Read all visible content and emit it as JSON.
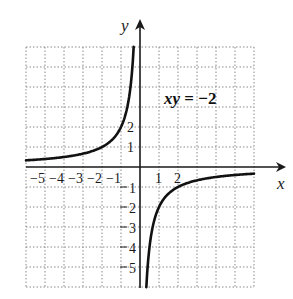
{
  "chart_data": {
    "type": "line",
    "title": "",
    "annotation": "xy = −2",
    "function": "y = -2/x",
    "xlabel": "x",
    "ylabel": "y",
    "xlim": [
      -6,
      6
    ],
    "ylim": [
      -6,
      6
    ],
    "grid": true,
    "grid_style": "dotted",
    "x_tick_labels": [
      "−5",
      "−4",
      "−3",
      "−2",
      "−1",
      "1",
      "2"
    ],
    "x_ticks": [
      -5,
      -4,
      -3,
      -2,
      -1,
      1,
      2
    ],
    "y_tick_labels": [
      "2",
      "1",
      "−1",
      "−2",
      "−3",
      "−4",
      "−5"
    ],
    "y_ticks": [
      2,
      1,
      -1,
      -2,
      -3,
      -4,
      -5
    ],
    "series": [
      {
        "name": "xy = −2 (left branch, x<0)",
        "x": [
          -6,
          -5,
          -4,
          -3,
          -2,
          -1.5,
          -1,
          -0.75,
          -0.5,
          -0.4,
          -0.333
        ],
        "y": [
          0.333,
          0.4,
          0.5,
          0.667,
          1,
          1.333,
          2,
          2.667,
          4,
          5,
          6
        ]
      },
      {
        "name": "xy = −2 (right branch, x>0)",
        "x": [
          0.333,
          0.4,
          0.5,
          0.75,
          1,
          1.5,
          2,
          3,
          4,
          5,
          6
        ],
        "y": [
          -6,
          -5,
          -4,
          -2.667,
          -2,
          -1.333,
          -1,
          -0.667,
          -0.5,
          -0.4,
          -0.333
        ]
      }
    ]
  },
  "labels": {
    "x_axis": "x",
    "y_axis": "y",
    "equation_var": "xy",
    "equation_rest": " = −2",
    "x_ticks": [
      "−5",
      "−4",
      "−3",
      "−2",
      "−1",
      "1",
      "2"
    ],
    "y_pos_ticks": [
      "2",
      "1"
    ],
    "y_neg_ticks": [
      "1",
      "2",
      "3",
      "4",
      "5"
    ]
  }
}
